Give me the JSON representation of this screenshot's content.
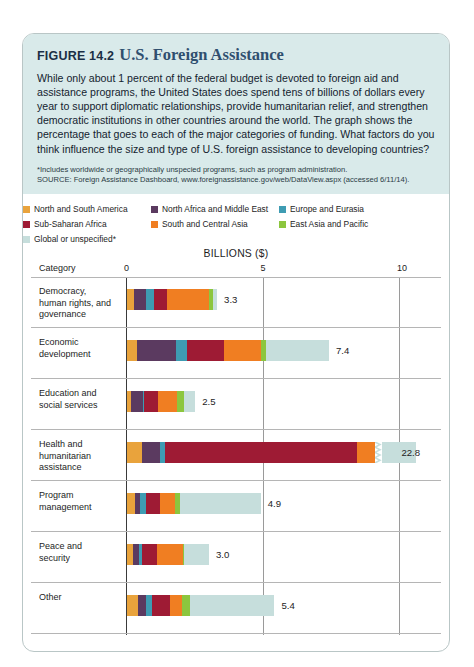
{
  "figure": {
    "label": "FIGURE 14.2",
    "title": "U.S. Foreign Assistance",
    "description": "While only about 1 percent of the federal budget is devoted to foreign aid and assistance programs, the United States does spend tens of billions of dollars every year to support diplomatic relationships, provide humanitarian relief, and strengthen democratic institutions in other countries around the world. The graph shows the percentage that goes to each of the major categories of funding. What factors do you think influence the size and type of U.S. foreign assistance to developing countries?",
    "footnote": "*Includes worldwide or geographically unspecied programs, such as program administration.",
    "source": "SOURCE: Foreign Assistance Dashboard, www.foreignassistance.gov/web/DataView.aspx (accessed 6/11/14)."
  },
  "chart_data": {
    "type": "bar",
    "orientation": "horizontal",
    "stacked": true,
    "title": "U.S. Foreign Assistance",
    "xlabel": "BILLIONS ($)",
    "ylabel": "Category",
    "category_header": "Category",
    "xlim": [
      0,
      10
    ],
    "xticks": [
      0,
      5,
      10
    ],
    "xtick_labels": [
      "0",
      "5",
      "10"
    ],
    "grid": true,
    "legend_position": "top",
    "axis_break_note": "Health and humanitarian assistance bar is truncated with a zigzag break; true value 22.8",
    "legend": [
      {
        "name": "North and South America",
        "color": "#E9A33C"
      },
      {
        "name": "North Africa and Middle East",
        "color": "#5B3A60"
      },
      {
        "name": "Europe and Eurasia",
        "color": "#3E9CB3"
      },
      {
        "name": "Sub-Saharan Africa",
        "color": "#9E1B34"
      },
      {
        "name": "South and Central Asia",
        "color": "#F07E22"
      },
      {
        "name": "East Asia and Pacific",
        "color": "#8CC63E"
      },
      {
        "name": "Global or unspecified*",
        "color": "#C6DEDC"
      }
    ],
    "categories": [
      "Democracy, human rights, and governance",
      "Economic development",
      "Education and social services",
      "Health and humanitarian assistance",
      "Program management",
      "Peace and security",
      "Other"
    ],
    "totals": [
      3.3,
      7.4,
      2.5,
      22.8,
      4.9,
      3.0,
      5.4
    ],
    "total_labels": [
      "3.3",
      "7.4",
      "2.5",
      "22.8",
      "4.9",
      "3.0",
      "5.4"
    ],
    "series": [
      {
        "name": "North and South America",
        "color": "#E9A33C",
        "values": [
          0.25,
          0.35,
          0.15,
          0.55,
          0.3,
          0.22,
          0.4
        ]
      },
      {
        "name": "North Africa and Middle East",
        "color": "#5B3A60",
        "values": [
          0.45,
          1.45,
          0.42,
          0.65,
          0.18,
          0.22,
          0.3
        ]
      },
      {
        "name": "Europe and Eurasia",
        "color": "#3E9CB3",
        "values": [
          0.3,
          0.4,
          0.05,
          0.18,
          0.22,
          0.1,
          0.22
        ]
      },
      {
        "name": "Sub-Saharan Africa",
        "color": "#9E1B34",
        "values": [
          0.45,
          1.35,
          0.5,
          7.05,
          0.5,
          0.55,
          0.65
        ]
      },
      {
        "name": "South and Central Asia",
        "color": "#F07E22",
        "values": [
          1.55,
          1.35,
          0.7,
          0.8,
          0.55,
          0.95,
          0.45
        ]
      },
      {
        "name": "East Asia and Pacific",
        "color": "#8CC63E",
        "values": [
          0.15,
          0.18,
          0.28,
          0.52,
          0.18,
          0.06,
          0.28
        ]
      },
      {
        "name": "Global or unspecified*",
        "color": "#C6DEDC",
        "values": [
          0.15,
          2.32,
          0.4,
          2.05,
          2.97,
          0.9,
          3.1
        ]
      }
    ]
  }
}
